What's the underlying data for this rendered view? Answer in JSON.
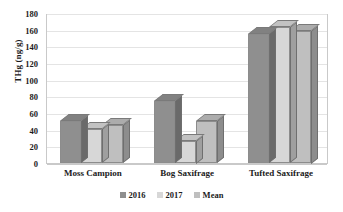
{
  "chart_data": {
    "type": "bar",
    "title": "",
    "subtitle": "",
    "xlabel": "",
    "ylabel": "THg (ng/g)",
    "ylim": [
      0,
      180
    ],
    "ytick_step": 20,
    "yticks": [
      180,
      160,
      140,
      120,
      100,
      80,
      60,
      40,
      20,
      0
    ],
    "grid": true,
    "legend_position": "bottom",
    "style_3d": true,
    "categories": [
      "Moss Campion",
      "Bog Saxifrage",
      "Tufted Saxifrage"
    ],
    "series": [
      {
        "name": "2016",
        "values": [
          50,
          74,
          155
        ],
        "color": "#8f8f8f"
      },
      {
        "name": "2017",
        "values": [
          41,
          27,
          163
        ],
        "color": "#d7d7d7"
      },
      {
        "name": "Mean",
        "values": [
          46,
          50,
          159
        ],
        "color": "#bfbfbf"
      }
    ]
  },
  "axis": {
    "y_title": "THg (ng/g)"
  },
  "legend": {
    "items": [
      {
        "label": "2016",
        "color": "#8f8f8f"
      },
      {
        "label": "2017",
        "color": "#d7d7d7"
      },
      {
        "label": "Mean",
        "color": "#bfbfbf"
      }
    ]
  }
}
